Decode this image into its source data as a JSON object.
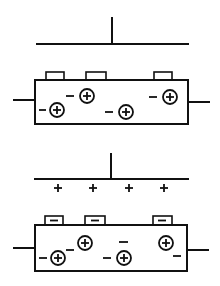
{
  "diagram": {
    "colors": {
      "stroke": "#111111",
      "background": "#ffffff"
    },
    "panels": [
      {
        "id": "uncharged",
        "plate_charges": [],
        "tabs": [
          {
            "x": 46,
            "w": 18,
            "symbol": ""
          },
          {
            "x": 86,
            "w": 20,
            "symbol": ""
          },
          {
            "x": 154,
            "w": 18,
            "symbol": ""
          }
        ],
        "dipoles": [
          {
            "label": "−⊕",
            "cx": 57,
            "cy": 110
          },
          {
            "label": "−⊕",
            "cx": 87,
            "cy": 96
          },
          {
            "label": "−⊕",
            "cx": 126,
            "cy": 112
          },
          {
            "label": "−⊕",
            "cx": 170,
            "cy": 97
          }
        ]
      },
      {
        "id": "charged",
        "plate_charges": [
          "+",
          "+",
          "+",
          "+"
        ],
        "tabs": [
          {
            "x": 45,
            "w": 18,
            "symbol": "−"
          },
          {
            "x": 85,
            "w": 20,
            "symbol": "−"
          },
          {
            "x": 153,
            "w": 19,
            "symbol": "−"
          }
        ],
        "free_charges": [
          "−",
          "−",
          "−"
        ],
        "dipoles": [
          {
            "label": "−⊕",
            "cx": 58,
            "cy": 258
          },
          {
            "label": "−⊕",
            "cx": 85,
            "cy": 243
          },
          {
            "label": "−⊕",
            "cx": 124,
            "cy": 258
          },
          {
            "label": "⊕−",
            "cx": 166,
            "cy": 243
          }
        ]
      }
    ]
  }
}
